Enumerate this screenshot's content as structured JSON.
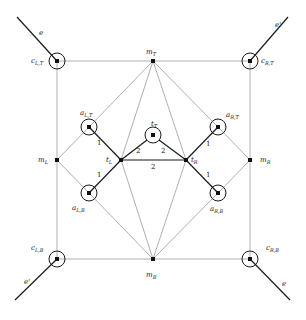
{
  "diagram": {
    "type": "graph",
    "colors": {
      "heavy_edge": "#1a1a1a",
      "light_edge": "#b0b0b0",
      "node": "#111111"
    },
    "nodes": {
      "c_LT": {
        "base": "c",
        "sub": "L,T",
        "x": 57,
        "y": 61,
        "circled": true
      },
      "c_RT": {
        "base": "c",
        "sub": "R,T",
        "x": 250,
        "y": 61,
        "circled": true
      },
      "c_LB": {
        "base": "c",
        "sub": "L,B",
        "x": 57,
        "y": 259,
        "circled": true
      },
      "c_RB": {
        "base": "c",
        "sub": "R,B",
        "x": 250,
        "y": 259,
        "circled": true
      },
      "m_T": {
        "base": "m",
        "sub": "T",
        "x": 153,
        "y": 61,
        "circled": false
      },
      "m_B": {
        "base": "m",
        "sub": "B",
        "x": 153,
        "y": 259,
        "circled": false
      },
      "m_L": {
        "base": "m",
        "sub": "L",
        "x": 57,
        "y": 160,
        "circled": false
      },
      "m_R": {
        "base": "m",
        "sub": "R",
        "x": 250,
        "y": 160,
        "circled": false
      },
      "a_LT": {
        "base": "a",
        "sub": "L,T",
        "x": 89,
        "y": 127,
        "circled": true
      },
      "a_RT": {
        "base": "a",
        "sub": "R,T",
        "x": 218,
        "y": 127,
        "circled": true
      },
      "a_LB": {
        "base": "a",
        "sub": "L,B",
        "x": 89,
        "y": 193,
        "circled": true
      },
      "a_RB": {
        "base": "a",
        "sub": "R,B",
        "x": 218,
        "y": 193,
        "circled": true
      },
      "t_L": {
        "base": "t",
        "sub": "L",
        "x": 121,
        "y": 160,
        "circled": false
      },
      "t_R": {
        "base": "t",
        "sub": "R",
        "x": 186,
        "y": 160,
        "circled": false
      },
      "t_T": {
        "base": "t",
        "sub": "T",
        "x": 153,
        "y": 135,
        "circled": true
      }
    },
    "external_edges": [
      {
        "label": "e",
        "from": [
          17,
          17
        ],
        "to": [
          57,
          61
        ]
      },
      {
        "label": "e'",
        "from": [
          288,
          17
        ],
        "to": [
          250,
          61
        ]
      },
      {
        "label": "e'",
        "from": [
          15,
          300
        ],
        "to": [
          57,
          259
        ]
      },
      {
        "label": "e",
        "from": [
          290,
          300
        ],
        "to": [
          250,
          259
        ]
      }
    ],
    "edge_weights": {
      "a_LT_t_L": "1",
      "a_LB_t_L": "1",
      "a_RT_t_R": "1",
      "a_RB_t_R": "1",
      "t_L_t_T": "2",
      "t_T_t_R": "2",
      "t_L_t_R": "2"
    },
    "labels": {
      "c_LT": "c",
      "c_LT_sub": "L,T",
      "c_RT": "c",
      "c_RT_sub": "R,T",
      "c_LB": "c",
      "c_LB_sub": "L,B",
      "c_RB": "c",
      "c_RB_sub": "R,B",
      "m_T": "m",
      "m_T_sub": "T",
      "m_B": "m",
      "m_B_sub": "B",
      "m_L": "m",
      "m_L_sub": "L",
      "m_R": "m",
      "m_R_sub": "R",
      "a_LT": "a",
      "a_LT_sub": "L,T",
      "a_RT": "a",
      "a_RT_sub": "R,T",
      "a_LB": "a",
      "a_LB_sub": "L,B",
      "a_RB": "a",
      "a_RB_sub": "R,B",
      "t_L": "t",
      "t_L_sub": "L",
      "t_R": "t",
      "t_R_sub": "R",
      "t_T": "t",
      "t_T_sub": "T",
      "e_top_left": "e",
      "e_top_right": "e'",
      "e_bottom_left": "e'",
      "e_bottom_right": "e"
    }
  }
}
